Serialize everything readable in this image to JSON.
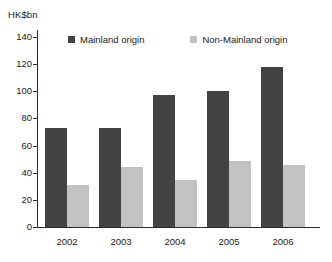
{
  "chart_data": {
    "type": "bar",
    "title": "",
    "unit_label": "HK$bn",
    "xlabel": "",
    "ylabel": "",
    "categories": [
      "2002",
      "2003",
      "2004",
      "2005",
      "2006"
    ],
    "series": [
      {
        "name": "Mainland origin",
        "color": "#434343",
        "values": [
          73,
          73,
          97,
          100,
          118
        ]
      },
      {
        "name": "Non-Mainland origin",
        "color": "#c2c2c2",
        "values": [
          31,
          44,
          35,
          49,
          46
        ]
      }
    ],
    "ylim": [
      0,
      140
    ],
    "yticks": [
      "0",
      "20",
      "40",
      "60",
      "80",
      "100",
      "120",
      "140"
    ],
    "grid": false,
    "legend_position": "top-inside"
  },
  "legend": {
    "items": [
      {
        "label": "Mainland origin"
      },
      {
        "label": "Non-Mainland origin"
      }
    ]
  }
}
